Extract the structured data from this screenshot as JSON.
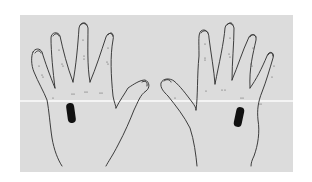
{
  "image": {
    "description": "Line drawing of two hands (palms facing viewer) with black rectangular markers on the palms",
    "background_color": "#dcdcdc",
    "line_color": "#2a2a2a",
    "marker_color": "#111111"
  },
  "hands": [
    {
      "side": "left",
      "marker": "palm-marker-left"
    },
    {
      "side": "right",
      "marker": "palm-marker-right"
    }
  ]
}
